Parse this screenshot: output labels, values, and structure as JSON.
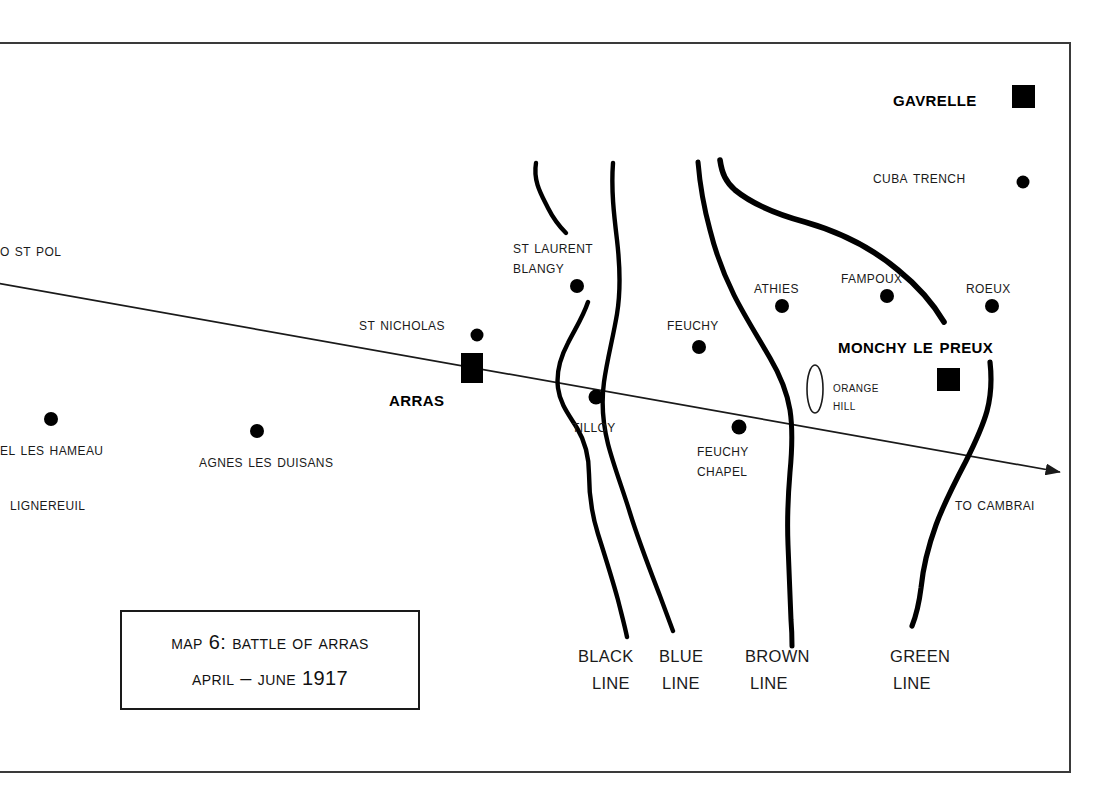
{
  "map": {
    "title_box": {
      "line1": "Map 6:  Battle of Arras",
      "line2": "April – June 1917"
    },
    "roads": [
      {
        "name": "arras-cambrai-road",
        "start_label": "o St Pol",
        "end_label": "To Cambrai",
        "has_arrow": true
      }
    ],
    "trench_lines": [
      {
        "name": "black-line",
        "label_top": "BLACK",
        "label_bottom": "LINE",
        "color_name": "black"
      },
      {
        "name": "blue-line",
        "label_top": "BLUE",
        "label_bottom": "LINE",
        "color_name": "blue"
      },
      {
        "name": "brown-line",
        "label_top": "BROWN",
        "label_bottom": "LINE",
        "color_name": "brown"
      },
      {
        "name": "green-line",
        "label_top": "GREEN",
        "label_bottom": "LINE",
        "color_name": "green"
      }
    ],
    "places": [
      {
        "name": "gavrelle",
        "label": "Gavrelle",
        "marker": "square",
        "emphasis": "bold"
      },
      {
        "name": "cuba-trench",
        "label": "Cuba Trench",
        "marker": "dot",
        "emphasis": "normal"
      },
      {
        "name": "st-laurent-blangy",
        "label": "St Laurent\nBlangy",
        "marker": "dot",
        "emphasis": "normal"
      },
      {
        "name": "st-nicholas",
        "label": "St Nicholas",
        "marker": "dot",
        "emphasis": "normal"
      },
      {
        "name": "arras",
        "label": "Arras",
        "marker": "square",
        "emphasis": "bold"
      },
      {
        "name": "tilloy",
        "label": "Tilloy",
        "marker": "dot",
        "emphasis": "normal"
      },
      {
        "name": "feuchy",
        "label": "Feuchy",
        "marker": "dot",
        "emphasis": "normal"
      },
      {
        "name": "feuchy-chapel",
        "label": "Feuchy\nChapel",
        "marker": "dot",
        "emphasis": "normal"
      },
      {
        "name": "athies",
        "label": "Athies",
        "marker": "dot",
        "emphasis": "normal"
      },
      {
        "name": "fampoux",
        "label": "Fampoux",
        "marker": "dot",
        "emphasis": "normal"
      },
      {
        "name": "roeux",
        "label": "Roeux",
        "marker": "dot",
        "emphasis": "normal"
      },
      {
        "name": "monchy-le-preux",
        "label": "Monchy Le Preux",
        "marker": "square",
        "emphasis": "bold"
      },
      {
        "name": "orange-hill",
        "label": "Orange\nHill",
        "marker": "ellipse",
        "emphasis": "normal"
      },
      {
        "name": "el-les-hameau",
        "label": "el Les Hameau",
        "marker": "dot",
        "emphasis": "normal"
      },
      {
        "name": "agnes-les-duisans",
        "label": "Agnes Les Duisans",
        "marker": "dot",
        "emphasis": "normal"
      },
      {
        "name": "lignereuil",
        "label": "Lignereuil",
        "marker": "none",
        "emphasis": "normal"
      }
    ],
    "labels": {
      "gavrelle": "Gavrelle",
      "cuba_trench": "Cuba Trench",
      "st_laurent_blangy_1": "St Laurent",
      "st_laurent_blangy_2": "Blangy",
      "st_nicholas": "St Nicholas",
      "arras": "Arras",
      "tilloy": "Tilloy",
      "feuchy": "Feuchy",
      "feuchy_chapel_1": "Feuchy",
      "feuchy_chapel_2": "Chapel",
      "athies": "Athies",
      "fampoux": "Fampoux",
      "roeux": "Roeux",
      "monchy_le_preux": "Monchy Le Preux",
      "orange_hill_1": "Orange",
      "orange_hill_2": "Hill",
      "to_st_pol": "o St Pol",
      "to_cambrai": "To Cambrai",
      "el_les_hameau": "el Les Hameau",
      "agnes_les_duisans": "Agnes Les Duisans",
      "lignereuil": "Lignereuil",
      "black_line_1": "BLACK",
      "black_line_2": "LINE",
      "blue_line_1": "BLUE",
      "blue_line_2": "LINE",
      "brown_line_1": "BROWN",
      "brown_line_2": "LINE",
      "green_line_1": "GREEN",
      "green_line_2": "LINE"
    },
    "colors": {
      "ink": "#000000",
      "label_ink": "#1a1a1a",
      "frame": "#3a3a3a",
      "background": "#ffffff"
    }
  }
}
